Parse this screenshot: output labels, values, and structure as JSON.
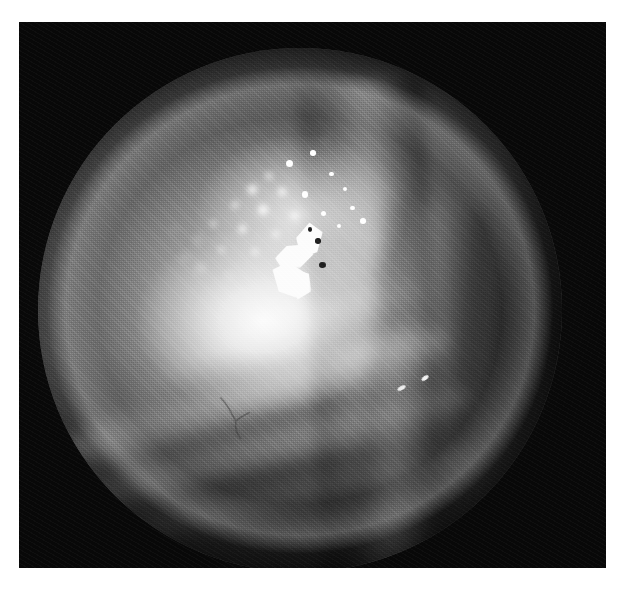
{
  "page": {
    "width": 628,
    "height": 596,
    "background_color": "#ffffff",
    "caption": ""
  },
  "photograph": {
    "name": "endoscopic-photograph",
    "modality": "endoscopic / fundus photograph",
    "color_mode": "grayscale",
    "frame": {
      "left": 19,
      "top": 22,
      "width": 587,
      "height": 546,
      "surround_color": "#080808"
    },
    "aperture": {
      "shape": "circle",
      "center_x": 300,
      "center_y": 310,
      "radius": 262,
      "cropped_edge": "bottom",
      "rim_highlight": "upper-left arc"
    },
    "tone": {
      "highlight_color": "#ffffff",
      "midtone_color": "#9a9a9a",
      "shadow_color": "#131313",
      "surround_color": "#080808"
    },
    "features": [
      {
        "name": "illumination-glare",
        "label": "central specular illumination glare",
        "center_x_pct": 43,
        "center_y_pct": 52
      },
      {
        "name": "exudate-cluster",
        "label": "punctate bright exudate cluster",
        "center_x_pct": 50,
        "center_y_pct": 30
      },
      {
        "name": "crystalline-structure",
        "label": "angular crystalline bright lesion",
        "center_x_pct": 50,
        "center_y_pct": 40
      },
      {
        "name": "tissue-ridge",
        "label": "vertical tissue ridge / fold",
        "center_x_pct": 64,
        "center_y_pct": 50
      },
      {
        "name": "tissue-folds",
        "label": "diagonal tissue folds",
        "center_x_pct": 40,
        "center_y_pct": 72
      },
      {
        "name": "specular-pair",
        "label": "paired specular highlights on ridge",
        "center_x_pct": 70,
        "center_y_pct": 65
      }
    ],
    "spots": [
      {
        "x": 48.0,
        "y": 22.0,
        "d": 7.0,
        "k": "hard"
      },
      {
        "x": 52.5,
        "y": 20.0,
        "d": 5.5,
        "k": "hard"
      },
      {
        "x": 44.0,
        "y": 24.5,
        "d": 6.0,
        "k": "soft"
      },
      {
        "x": 56.0,
        "y": 24.0,
        "d": 4.5,
        "k": "hard"
      },
      {
        "x": 41.0,
        "y": 27.0,
        "d": 9.0,
        "k": "soft"
      },
      {
        "x": 46.5,
        "y": 27.5,
        "d": 8.0,
        "k": "soft"
      },
      {
        "x": 51.0,
        "y": 28.0,
        "d": 6.5,
        "k": "hard"
      },
      {
        "x": 58.5,
        "y": 27.0,
        "d": 4.0,
        "k": "hard"
      },
      {
        "x": 37.5,
        "y": 30.0,
        "d": 6.0,
        "k": "soft"
      },
      {
        "x": 43.0,
        "y": 31.0,
        "d": 10.0,
        "k": "soft"
      },
      {
        "x": 49.0,
        "y": 32.0,
        "d": 7.0,
        "k": "soft"
      },
      {
        "x": 54.5,
        "y": 31.5,
        "d": 5.0,
        "k": "hard"
      },
      {
        "x": 60.0,
        "y": 30.5,
        "d": 4.5,
        "k": "hard"
      },
      {
        "x": 33.5,
        "y": 33.5,
        "d": 5.0,
        "k": "soft"
      },
      {
        "x": 39.0,
        "y": 34.5,
        "d": 7.5,
        "k": "soft"
      },
      {
        "x": 45.5,
        "y": 35.5,
        "d": 6.0,
        "k": "soft"
      },
      {
        "x": 52.0,
        "y": 35.0,
        "d": 5.5,
        "k": "hard"
      },
      {
        "x": 57.5,
        "y": 34.0,
        "d": 4.0,
        "k": "hard"
      },
      {
        "x": 30.5,
        "y": 36.5,
        "d": 6.5,
        "k": "faint"
      },
      {
        "x": 35.0,
        "y": 38.5,
        "d": 5.5,
        "k": "soft"
      },
      {
        "x": 41.5,
        "y": 39.0,
        "d": 6.0,
        "k": "soft"
      },
      {
        "x": 47.0,
        "y": 40.5,
        "d": 5.0,
        "k": "soft"
      },
      {
        "x": 31.0,
        "y": 42.0,
        "d": 7.0,
        "k": "faint"
      },
      {
        "x": 36.5,
        "y": 43.5,
        "d": 5.0,
        "k": "faint"
      },
      {
        "x": 28.0,
        "y": 40.0,
        "d": 5.0,
        "k": "faint"
      },
      {
        "x": 62.0,
        "y": 33.0,
        "d": 5.5,
        "k": "hard"
      },
      {
        "x": 64.5,
        "y": 36.5,
        "d": 4.0,
        "k": "faint"
      },
      {
        "x": 26.0,
        "y": 34.5,
        "d": 4.0,
        "k": "faint"
      },
      {
        "x": 55.0,
        "y": 17.5,
        "d": 3.5,
        "k": "faint"
      },
      {
        "x": 20.5,
        "y": 44.0,
        "d": 3.5,
        "k": "faint"
      }
    ],
    "speculars": [
      {
        "x": 68.5,
        "y": 64.5,
        "w": 9,
        "h": 4,
        "rot": -28
      },
      {
        "x": 73.0,
        "y": 62.5,
        "w": 8,
        "h": 4,
        "rot": -34
      }
    ]
  }
}
